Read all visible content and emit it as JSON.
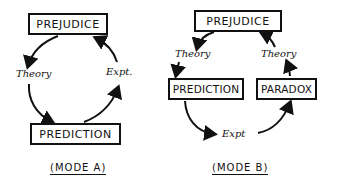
{
  "modeA": {
    "nodes": {
      "top": "PREJUDICE",
      "bottom": "PREDICTION"
    },
    "edges": {
      "left": "Theory",
      "right": "Expt."
    },
    "caption": "(MODE A)"
  },
  "modeB": {
    "nodes": {
      "top": "PREJUDICE",
      "left": "PREDICTION",
      "right": "PARADOX"
    },
    "edges": {
      "left": "Theory",
      "right": "Theory",
      "bottom": "Expt"
    },
    "caption": "(MODE B)"
  }
}
